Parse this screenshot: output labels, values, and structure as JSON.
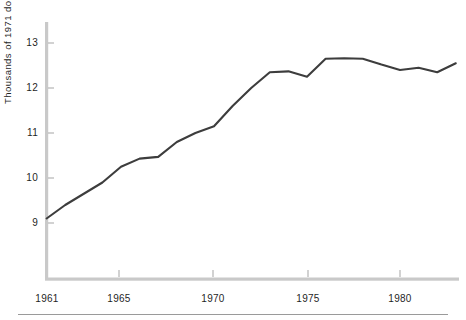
{
  "chart_data": {
    "type": "line",
    "title": "",
    "xlabel": "",
    "ylabel": "Thousands of 1971 dollars",
    "xlim": [
      1961,
      1983
    ],
    "ylim": [
      8.7,
      13.35
    ],
    "grid": false,
    "legend": null,
    "x_tick_labels": [
      "1961",
      "1965",
      "1970",
      "1975",
      "1980"
    ],
    "x_ticks": [
      1961,
      1965,
      1970,
      1975,
      1980
    ],
    "y_tick_labels": [
      "9",
      "10",
      "11",
      "12",
      "13"
    ],
    "y_ticks": [
      9,
      10,
      11,
      12,
      13
    ],
    "line_color": "#3d3d3d",
    "axis_color": "#c9c9c9",
    "x": [
      1961,
      1962,
      1963,
      1964,
      1965,
      1966,
      1967,
      1968,
      1969,
      1970,
      1971,
      1972,
      1973,
      1974,
      1975,
      1976,
      1977,
      1978,
      1979,
      1980,
      1981,
      1982,
      1983
    ],
    "values": [
      9.1,
      9.4,
      9.65,
      9.9,
      10.25,
      10.43,
      10.47,
      10.8,
      11.0,
      11.15,
      11.6,
      12.0,
      12.35,
      12.37,
      12.25,
      12.65,
      12.66,
      12.65,
      12.52,
      12.4,
      12.45,
      12.35,
      12.55
    ],
    "series": [
      {
        "name": "Income",
        "values": [
          9.1,
          9.4,
          9.65,
          9.9,
          10.25,
          10.43,
          10.47,
          10.8,
          11.0,
          11.15,
          11.6,
          12.0,
          12.35,
          12.37,
          12.25,
          12.65,
          12.66,
          12.65,
          12.52,
          12.4,
          12.45,
          12.35,
          12.55
        ]
      }
    ]
  },
  "axis": {
    "y_title": "Thousands of 1971 dollars"
  },
  "ticks": {
    "y": [
      {
        "label": "13"
      },
      {
        "label": "12"
      },
      {
        "label": "11"
      },
      {
        "label": "10"
      },
      {
        "label": "9"
      }
    ],
    "x": [
      {
        "label": "1961"
      },
      {
        "label": "1965"
      },
      {
        "label": "1970"
      },
      {
        "label": "1975"
      },
      {
        "label": "1980"
      }
    ]
  }
}
